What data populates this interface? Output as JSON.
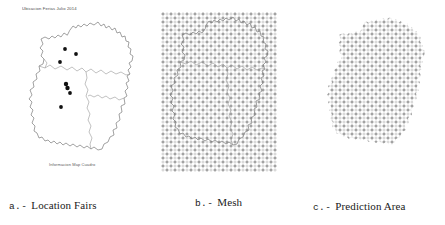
{
  "figure": {
    "background": "#ffffff",
    "width": 445,
    "height": 225
  },
  "panel_a": {
    "id": "a",
    "title": "Ubicacion Ferias Julio 2014",
    "source_note": "Informacion Map Cuadro",
    "caption_tag": "a.-",
    "caption_label": "Location Fairs",
    "marker_color": "#111111",
    "outline_color": "#7a7a7a",
    "marker_count": 7,
    "fair_points": [
      {
        "x": 62.0,
        "y": 46.5
      },
      {
        "x": 71.5,
        "y": 50.5
      },
      {
        "x": 58.5,
        "y": 58.0
      },
      {
        "x": 63.5,
        "y": 78.0
      },
      {
        "x": 64.5,
        "y": 81.0
      },
      {
        "x": 66.5,
        "y": 85.0
      },
      {
        "x": 59.5,
        "y": 97.0
      }
    ]
  },
  "panel_b": {
    "id": "b",
    "caption_tag": "b.-",
    "caption_label": "Mesh",
    "marker_glyph": "plus",
    "marker_color": "#3d3d3d",
    "grid_spacing_px": 4,
    "grid_cols": 29,
    "grid_rows": 40,
    "overlay": "region outline"
  },
  "panel_c": {
    "id": "c",
    "caption_tag": "c.-",
    "caption_label": "Prediction Area",
    "marker_glyph": "plus",
    "marker_color": "#3d3d3d",
    "grid_spacing_px": 4,
    "clipped_to": "region boundary"
  },
  "chart_data": {
    "type": "scatter",
    "title": "Ubicacion Ferias Julio 2014",
    "subtitle": "",
    "xlabel": "",
    "ylabel": "",
    "grid": false,
    "legend": "none",
    "panels": [
      {
        "key": "a",
        "label": "a.- Location Fairs",
        "series": [
          {
            "name": "Fairs",
            "marker": "filled-circle",
            "color": "#111111",
            "points": [
              [
                62.0,
                46.5
              ],
              [
                71.5,
                50.5
              ],
              [
                58.5,
                58.0
              ],
              [
                63.5,
                78.0
              ],
              [
                64.5,
                81.0
              ],
              [
                66.5,
                85.0
              ],
              [
                59.5,
                97.0
              ]
            ]
          }
        ]
      },
      {
        "key": "b",
        "label": "b.- Mesh",
        "series": [
          {
            "name": "Mesh nodes",
            "marker": "plus",
            "color": "#3d3d3d",
            "layout": "regular-rectangular-grid",
            "spacing": 4,
            "cols": 29,
            "rows": 40
          }
        ]
      },
      {
        "key": "c",
        "label": "c.- Prediction Area",
        "series": [
          {
            "name": "Prediction nodes",
            "marker": "plus",
            "color": "#3d3d3d",
            "layout": "grid-clipped-to-region",
            "spacing": 4
          }
        ]
      }
    ]
  }
}
